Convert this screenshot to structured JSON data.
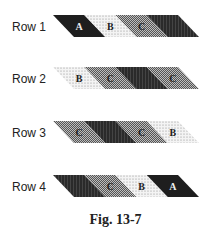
{
  "figure": {
    "caption": "Fig. 13-7",
    "rows": [
      {
        "label": "Row 1",
        "segments": [
          {
            "fill": "black",
            "letter": "A"
          },
          {
            "fill": "dotted",
            "letter": "B"
          },
          {
            "fill": "crosshatch",
            "letter": "C"
          },
          {
            "fill": "darkhatch",
            "letter": ""
          }
        ]
      },
      {
        "label": "Row 2",
        "segments": [
          {
            "fill": "dotted",
            "letter": "B"
          },
          {
            "fill": "crosshatch",
            "letter": "C"
          },
          {
            "fill": "darkhatch",
            "letter": ""
          },
          {
            "fill": "crosshatch",
            "letter": "C"
          }
        ]
      },
      {
        "label": "Row 3",
        "segments": [
          {
            "fill": "crosshatch",
            "letter": "C"
          },
          {
            "fill": "darkhatch",
            "letter": ""
          },
          {
            "fill": "crosshatch",
            "letter": "C"
          },
          {
            "fill": "dotted",
            "letter": "B"
          }
        ]
      },
      {
        "label": "Row 4",
        "segments": [
          {
            "fill": "darkhatch",
            "letter": ""
          },
          {
            "fill": "crosshatch",
            "letter": "C"
          },
          {
            "fill": "dotted",
            "letter": "B"
          },
          {
            "fill": "black",
            "letter": "A"
          }
        ]
      }
    ],
    "colors": {
      "black": "#1e1e1e",
      "dark": "#2a2a2a",
      "cross": "#8a8a8a",
      "dot_bg": "#f4f4f4",
      "dot": "#777777"
    }
  }
}
